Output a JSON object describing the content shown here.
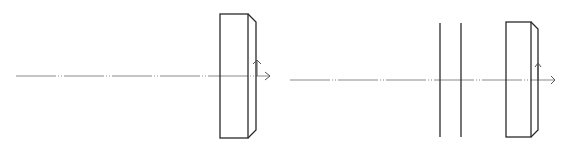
{
  "diagram": {
    "type": "optical-layout",
    "panels": [
      {
        "id": "left",
        "elements": [
          "optical-axis",
          "thick-plate-with-chamfered-edge",
          "arrow-up",
          "arrow-right"
        ]
      },
      {
        "id": "right",
        "elements": [
          "optical-axis",
          "thin-plate-1",
          "thin-plate-2",
          "thick-plate-with-chamfered-edge",
          "arrow-up",
          "arrow-right"
        ]
      }
    ],
    "colors": {
      "line": "#2a2a2a",
      "axis": "#8a8a8a",
      "background": "#ffffff"
    }
  }
}
